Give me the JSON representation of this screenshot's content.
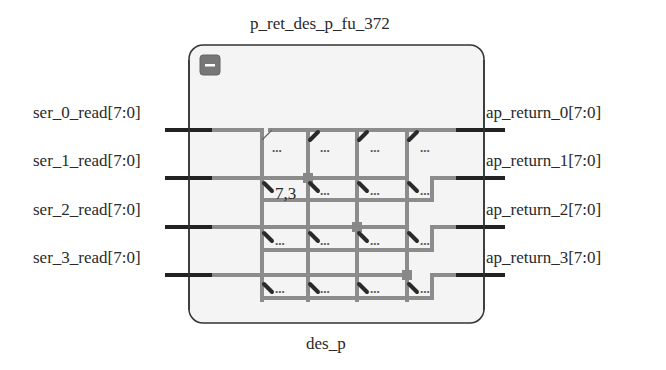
{
  "block": {
    "instance_name": "p_ret_des_p_fu_372",
    "module_name": "des_p",
    "collapse_button_icon": "minus-icon",
    "fill_color": "#f4f4f4",
    "border_color": "#333333"
  },
  "inputs": [
    {
      "name": "ser_0_read[7:0]"
    },
    {
      "name": "ser_1_read[7:0]"
    },
    {
      "name": "ser_2_read[7:0]"
    },
    {
      "name": "ser_3_read[7:0]"
    }
  ],
  "outputs": [
    {
      "name": "ap_return_0[7:0]"
    },
    {
      "name": "ap_return_1[7:0]"
    },
    {
      "name": "ap_return_2[7:0]"
    },
    {
      "name": "ap_return_3[7:0]"
    }
  ],
  "internal": {
    "bus_label": "7,3",
    "ellipsis": "...",
    "wire_color": "#8c8c8c",
    "bus_tick_color": "#2a2a2a",
    "port_color": "#222222"
  }
}
